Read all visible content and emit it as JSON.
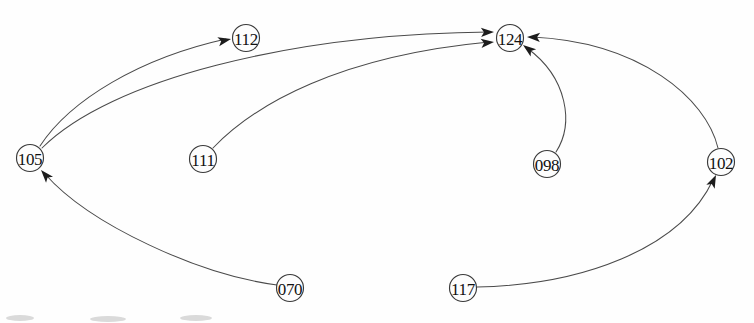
{
  "diagram": {
    "type": "directed-graph",
    "canvas": {
      "width": 754,
      "height": 323
    },
    "style": {
      "background_color": "#ffffff",
      "node_fill": "#fdfdfd",
      "node_stroke": "#3a3a3a",
      "edge_color": "#4a4a4a",
      "arrow_color": "#1c1c1c",
      "label_color": "#111111",
      "node_radius": 13.5
    },
    "nodes": [
      {
        "id": "105",
        "label": "105",
        "cx": 30,
        "cy": 158
      },
      {
        "id": "112",
        "label": "112",
        "cx": 246,
        "cy": 38
      },
      {
        "id": "111",
        "label": "111",
        "cx": 203,
        "cy": 159
      },
      {
        "id": "124",
        "label": "124",
        "cx": 510,
        "cy": 38
      },
      {
        "id": "098",
        "label": "098",
        "cx": 547,
        "cy": 164
      },
      {
        "id": "102",
        "label": "102",
        "cx": 721,
        "cy": 162
      },
      {
        "id": "070",
        "label": "070",
        "cx": 290,
        "cy": 288
      },
      {
        "id": "117",
        "label": "117",
        "cx": 463,
        "cy": 288
      }
    ],
    "edges": [
      {
        "id": "e1",
        "from": "105",
        "to": "112",
        "directed": true,
        "path": "M 40 146 C 70 100 140 58 226 39",
        "arrow": {
          "x": 231,
          "y": 39,
          "angle": -12
        }
      },
      {
        "id": "e2",
        "from": "105",
        "to": "124",
        "directed": true,
        "path": "M 42 148 C 110 80 290 34 489 32",
        "arrow": {
          "x": 494,
          "y": 32,
          "angle": -2
        }
      },
      {
        "id": "e3",
        "from": "111",
        "to": "124",
        "directed": true,
        "path": "M 213 148 C 255 104 340 56 489 42",
        "arrow": {
          "x": 494,
          "y": 42,
          "angle": -6
        }
      },
      {
        "id": "e4",
        "from": "098",
        "to": "124",
        "directed": true,
        "path": "M 556 152 C 574 124 568 78 527 48",
        "arrow": {
          "x": 523,
          "y": 45,
          "angle": -143
        }
      },
      {
        "id": "e5",
        "from": "102",
        "to": "124",
        "directed": true,
        "path": "M 718 148 C 706 98 640 42 532 37",
        "arrow": {
          "x": 527,
          "y": 37,
          "angle": 182
        }
      },
      {
        "id": "e6",
        "from": "070",
        "to": "105",
        "directed": true,
        "path": "M 277 285 C 200 275 90 225 45 174",
        "arrow": {
          "x": 41,
          "y": 170,
          "angle": -131
        }
      },
      {
        "id": "e7",
        "from": "117",
        "to": "102",
        "directed": true,
        "path": "M 477 287 C 580 285 680 250 713 180",
        "arrow": {
          "x": 716,
          "y": 175,
          "angle": -65
        }
      }
    ]
  }
}
